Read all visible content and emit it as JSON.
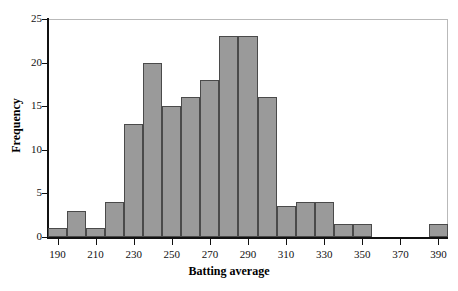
{
  "chart_data": {
    "type": "bar",
    "title": "",
    "subtitle": "",
    "xlabel": "Batting average",
    "ylabel": "Frequency",
    "xlim": [
      185,
      395
    ],
    "ylim": [
      0,
      25
    ],
    "bin_width": 10,
    "grid": false,
    "legend": null,
    "x_tick_labels": [
      "190",
      "210",
      "230",
      "250",
      "270",
      "290",
      "310",
      "330",
      "350",
      "370",
      "390"
    ],
    "x_tick_values": [
      190,
      210,
      230,
      250,
      270,
      290,
      310,
      330,
      350,
      370,
      390
    ],
    "y_tick_labels": [
      "0",
      "5",
      "10",
      "15",
      "20",
      "25"
    ],
    "y_tick_values": [
      0,
      5,
      10,
      15,
      20,
      25
    ],
    "bins": [
      {
        "start": 185,
        "end": 195,
        "value": 1
      },
      {
        "start": 195,
        "end": 205,
        "value": 3
      },
      {
        "start": 205,
        "end": 215,
        "value": 1
      },
      {
        "start": 215,
        "end": 225,
        "value": 4
      },
      {
        "start": 225,
        "end": 235,
        "value": 13
      },
      {
        "start": 235,
        "end": 245,
        "value": 20
      },
      {
        "start": 245,
        "end": 255,
        "value": 15
      },
      {
        "start": 255,
        "end": 265,
        "value": 16
      },
      {
        "start": 265,
        "end": 275,
        "value": 18
      },
      {
        "start": 275,
        "end": 285,
        "value": 23
      },
      {
        "start": 285,
        "end": 295,
        "value": 23
      },
      {
        "start": 295,
        "end": 305,
        "value": 16
      },
      {
        "start": 305,
        "end": 315,
        "value": 3.5
      },
      {
        "start": 315,
        "end": 325,
        "value": 4
      },
      {
        "start": 325,
        "end": 335,
        "value": 4
      },
      {
        "start": 335,
        "end": 345,
        "value": 1.5
      },
      {
        "start": 345,
        "end": 355,
        "value": 1.5
      },
      {
        "start": 355,
        "end": 365,
        "value": 0
      },
      {
        "start": 365,
        "end": 375,
        "value": 0
      },
      {
        "start": 375,
        "end": 385,
        "value": 0
      },
      {
        "start": 385,
        "end": 395,
        "value": 1.5
      }
    ],
    "categories": [
      "185-195",
      "195-205",
      "205-215",
      "215-225",
      "225-235",
      "235-245",
      "245-255",
      "255-265",
      "265-275",
      "275-285",
      "285-295",
      "295-305",
      "305-315",
      "315-325",
      "325-335",
      "335-345",
      "345-355",
      "355-365",
      "365-375",
      "375-385",
      "385-395"
    ],
    "values": [
      1,
      3,
      1,
      4,
      13,
      20,
      15,
      16,
      18,
      23,
      23,
      16,
      3.5,
      4,
      4,
      1.5,
      1.5,
      0,
      0,
      0,
      1.5
    ],
    "colors": {
      "bar_fill": "#9a9a9a",
      "bar_edge": "#4a4a4a",
      "axis": "#111111",
      "frame": "#b9b9b9",
      "background": "#ffffff",
      "text": "#000000"
    }
  }
}
